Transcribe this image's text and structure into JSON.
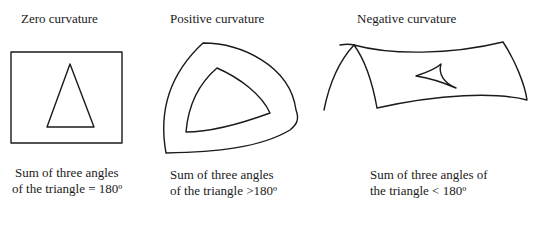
{
  "panels": [
    {
      "id": "zero",
      "title": "Zero curvature",
      "caption_line1": "Sum of three angles",
      "caption_line2": "of the triangle = 180º"
    },
    {
      "id": "positive",
      "title": "Positive curvature",
      "caption_line1": "Sum of three angles",
      "caption_line2": "of the triangle >180º"
    },
    {
      "id": "negative",
      "title": "Negative curvature",
      "caption_line1": "Sum of three angles of",
      "caption_line2": "the triangle < 180º"
    }
  ],
  "figure_caption_visible": false
}
